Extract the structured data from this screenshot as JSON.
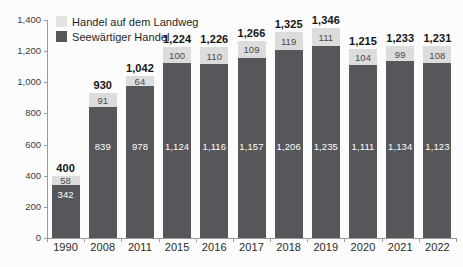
{
  "chart_data": {
    "type": "bar",
    "stacked": true,
    "title": "",
    "subtitle": "",
    "xlabel": "",
    "ylabel": "",
    "ylim": [
      0,
      1400
    ],
    "ytick_step": 200,
    "grid": false,
    "legend_position": "top-left",
    "categories": [
      "1990",
      "2008",
      "2011",
      "2015",
      "2016",
      "2017",
      "2018",
      "2019",
      "2020",
      "2021",
      "2022"
    ],
    "x": [
      "1990",
      "2008",
      "2011",
      "2015",
      "2016",
      "2017",
      "2018",
      "2019",
      "2020",
      "2021",
      "2022"
    ],
    "yticks": [
      "0",
      "200",
      "400",
      "600",
      "800",
      "1,000",
      "1,200",
      "1,400"
    ],
    "series": [
      {
        "name": "Seewärtiger Handel",
        "color": "#56575b",
        "values": [
          342,
          839,
          978,
          1124,
          1116,
          1157,
          1206,
          1235,
          1111,
          1134,
          1123
        ],
        "labels": [
          "342",
          "839",
          "978",
          "1,124",
          "1,116",
          "1,157",
          "1,206",
          "1,235",
          "1,111",
          "1,134",
          "1,123"
        ]
      },
      {
        "name": "Handel auf dem Landweg",
        "color": "#dcdcdc",
        "values": [
          58,
          91,
          64,
          100,
          110,
          109,
          119,
          111,
          104,
          99,
          108
        ],
        "labels": [
          "58",
          "91",
          "64",
          "100",
          "110",
          "109",
          "119",
          "111",
          "104",
          "99",
          "108"
        ]
      }
    ],
    "totals": [
      400,
      930,
      1042,
      1224,
      1226,
      1266,
      1325,
      1346,
      1215,
      1233,
      1231
    ],
    "total_labels": [
      "400",
      "930",
      "1,042",
      "1,224",
      "1,226",
      "1,266",
      "1,325",
      "1,346",
      "1,215",
      "1,233",
      "1,231"
    ]
  },
  "legend": {
    "items": [
      {
        "label": "Handel auf dem Landweg",
        "swatch": "land"
      },
      {
        "label": "Seewärtiger Handel",
        "swatch": "sea"
      }
    ]
  },
  "colors": {
    "sea": "#56575b",
    "land": "#dcdcdc",
    "axis": "#9a9a9a",
    "background": "#fcfcfc",
    "total_text": "#141414"
  }
}
